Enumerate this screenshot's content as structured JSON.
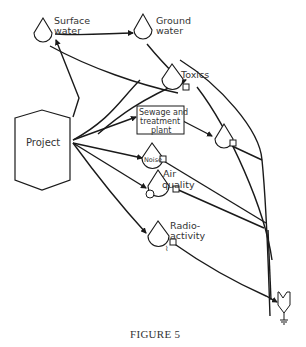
{
  "figure": {
    "caption": "FIGURE 5",
    "source_node": {
      "label": "Project"
    },
    "nodes": [
      {
        "id": "surface-water",
        "type": "storage",
        "label_lines": [
          "Surface",
          "water"
        ]
      },
      {
        "id": "ground-water",
        "type": "storage",
        "label_lines": [
          "Ground",
          "water"
        ]
      },
      {
        "id": "toxics",
        "type": "storage",
        "label_lines": [
          "Toxics"
        ]
      },
      {
        "id": "sewage-plant",
        "type": "process-box",
        "label_lines": [
          "Sewage and",
          "treatment",
          "plant"
        ]
      },
      {
        "id": "unlabeled-storage",
        "type": "storage",
        "label_lines": []
      },
      {
        "id": "noise",
        "type": "storage",
        "label_lines": [
          "Noise"
        ]
      },
      {
        "id": "air-quality",
        "type": "storage",
        "label_lines": [
          "Air",
          "quality"
        ]
      },
      {
        "id": "radioactivity",
        "type": "storage",
        "label_lines": [
          "Radio-",
          "activity"
        ]
      },
      {
        "id": "sink",
        "type": "sink-consumer",
        "label_lines": []
      }
    ],
    "colors": {
      "line": "#1a1a1a",
      "text": "#333333",
      "background": "#ffffff"
    }
  }
}
